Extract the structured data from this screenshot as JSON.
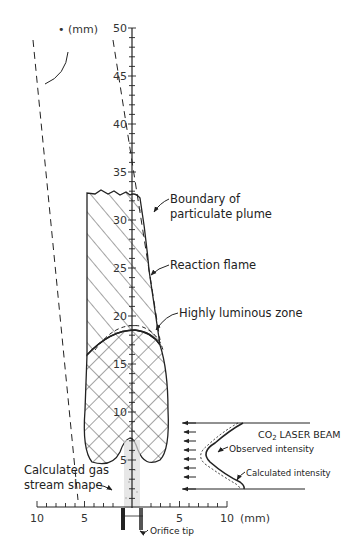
{
  "figure": {
    "vertical_axis": {
      "unit_label": "(mm)",
      "ticks": [
        "50",
        "45",
        "40",
        "35",
        "30",
        "25",
        "20",
        "15",
        "10",
        "5"
      ]
    },
    "horizontal_axis": {
      "unit_label": "(mm)",
      "ticks": [
        "10",
        "5",
        "5",
        "10"
      ]
    },
    "labels": {
      "boundary_line1": "Boundary of",
      "boundary_line2": "particulate plume",
      "reaction_flame": "Reaction flame",
      "luminous_zone": "Highly luminous zone",
      "laser_beam_prefix": "CO",
      "laser_beam_sub": "2",
      "laser_beam_suffix": " LASER BEAM",
      "observed_intensity": "Observed intensity",
      "calculated_intensity": "Calculated intensity",
      "gas_stream_line1": "Calculated gas",
      "gas_stream_line2": "stream shape",
      "orifice_tip": "Orifice tip"
    },
    "colors": {
      "ink": "#222222",
      "background": "#ffffff"
    }
  }
}
